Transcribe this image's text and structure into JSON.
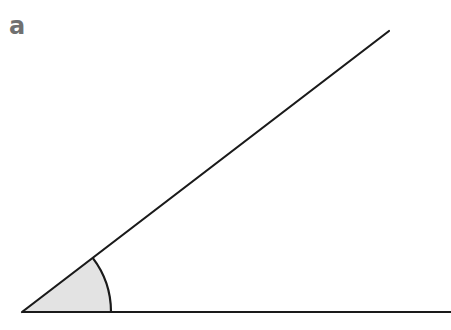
{
  "label": "a",
  "diagram": {
    "type": "angle",
    "vertex": [
      22,
      312
    ],
    "ray_upper_end": [
      389,
      31
    ],
    "ray_base_end": [
      451,
      312
    ],
    "arc_radius": 89,
    "arc_fill": "#e3e3e3",
    "line_color": "#1a1a1a",
    "label_color": "#707070"
  }
}
